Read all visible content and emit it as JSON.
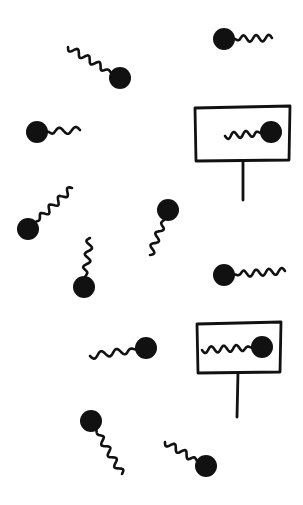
{
  "scene": {
    "description": "Hand-drawn illustration of swimming sperm with two signs each showing a sperm",
    "background": "#ffffff",
    "ink": "#111111",
    "sperm": [
      {
        "id": "sperm-1",
        "head": [
          120,
          78
        ],
        "r": 11,
        "tail_end": [
          68,
          47
        ]
      },
      {
        "id": "sperm-2",
        "head": [
          224,
          39
        ],
        "r": 11,
        "tail_end": [
          272,
          38
        ]
      },
      {
        "id": "sperm-3",
        "head": [
          37,
          132
        ],
        "r": 11,
        "tail_end": [
          80,
          130
        ]
      },
      {
        "id": "sperm-4",
        "head": [
          28,
          229
        ],
        "r": 11,
        "tail_end": [
          72,
          188
        ]
      },
      {
        "id": "sperm-5",
        "head": [
          168,
          210
        ],
        "r": 11,
        "tail_end": [
          150,
          255
        ]
      },
      {
        "id": "sperm-6",
        "head": [
          84,
          287
        ],
        "r": 11,
        "tail_end": [
          90,
          238
        ]
      },
      {
        "id": "sperm-7",
        "head": [
          224,
          275
        ],
        "r": 11,
        "tail_end": [
          285,
          271
        ]
      },
      {
        "id": "sperm-8",
        "head": [
          146,
          348
        ],
        "r": 11,
        "tail_end": [
          90,
          356
        ]
      },
      {
        "id": "sperm-9",
        "head": [
          91,
          421
        ],
        "r": 11,
        "tail_end": [
          122,
          474
        ]
      },
      {
        "id": "sperm-10",
        "head": [
          206,
          466
        ],
        "r": 11,
        "tail_end": [
          165,
          442
        ]
      }
    ],
    "signs": [
      {
        "id": "sign-1",
        "box": [
          195,
          107,
          290,
          160
        ],
        "post": [
          [
            243,
            160
          ],
          [
            243,
            200
          ]
        ],
        "sperm": {
          "head": [
            271,
            132
          ],
          "r": 11,
          "tail_end": [
            225,
            136
          ]
        }
      },
      {
        "id": "sign-2",
        "box": [
          197,
          323,
          281,
          372
        ],
        "post": [
          [
            238,
            372
          ],
          [
            237,
            417
          ]
        ],
        "sperm": {
          "head": [
            262,
            347
          ],
          "r": 11,
          "tail_end": [
            202,
            350
          ]
        }
      }
    ]
  }
}
